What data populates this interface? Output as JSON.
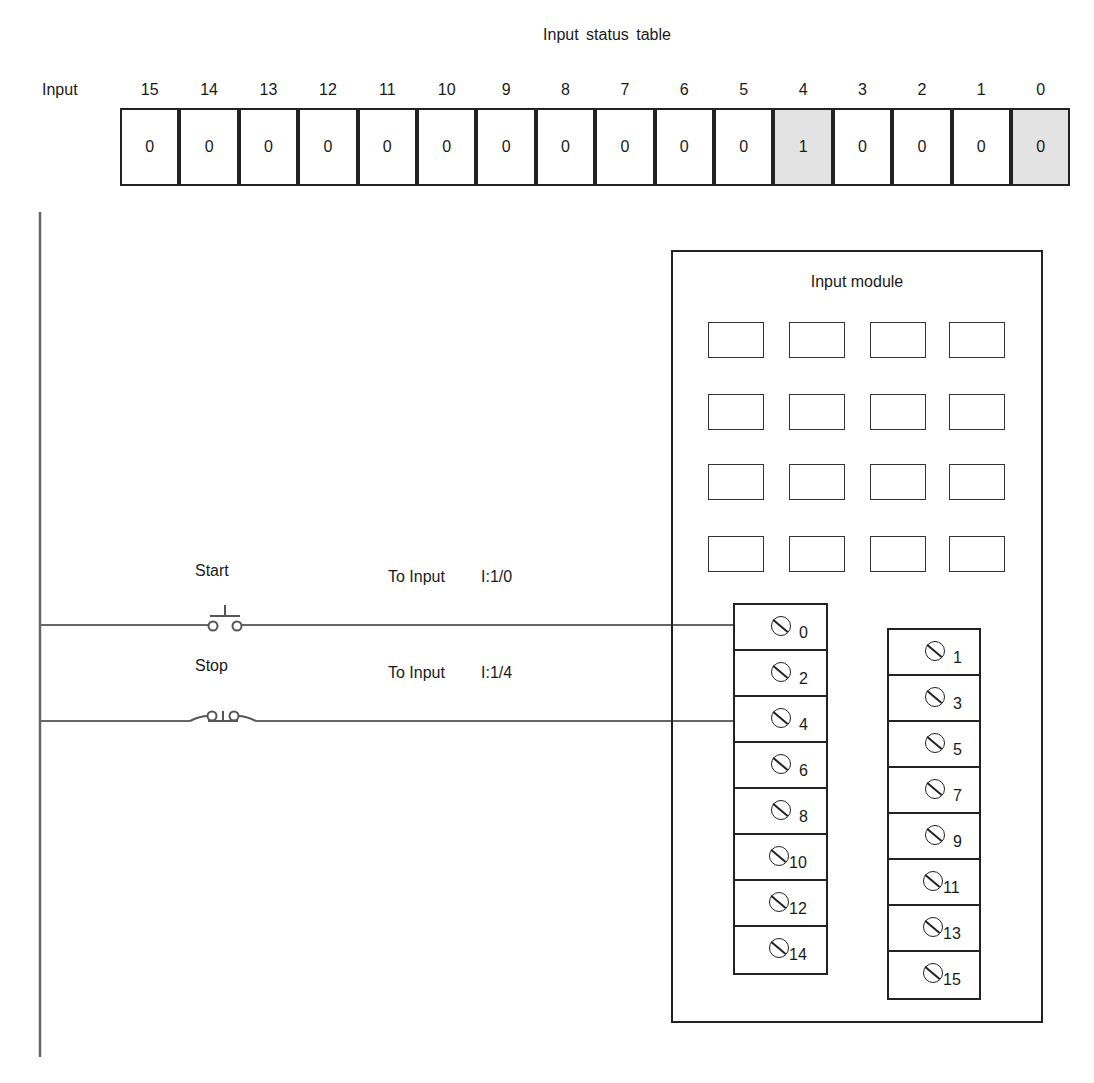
{
  "status_table": {
    "title": "Input status table",
    "row_label": "Input",
    "bits": [
      {
        "bit": "15",
        "value": "0",
        "highlight": false
      },
      {
        "bit": "14",
        "value": "0",
        "highlight": false
      },
      {
        "bit": "13",
        "value": "0",
        "highlight": false
      },
      {
        "bit": "12",
        "value": "0",
        "highlight": false
      },
      {
        "bit": "11",
        "value": "0",
        "highlight": false
      },
      {
        "bit": "10",
        "value": "0",
        "highlight": false
      },
      {
        "bit": "9",
        "value": "0",
        "highlight": false
      },
      {
        "bit": "8",
        "value": "0",
        "highlight": false
      },
      {
        "bit": "7",
        "value": "0",
        "highlight": false
      },
      {
        "bit": "6",
        "value": "0",
        "highlight": false
      },
      {
        "bit": "5",
        "value": "0",
        "highlight": false
      },
      {
        "bit": "4",
        "value": "1",
        "highlight": true
      },
      {
        "bit": "3",
        "value": "0",
        "highlight": false
      },
      {
        "bit": "2",
        "value": "0",
        "highlight": false
      },
      {
        "bit": "1",
        "value": "0",
        "highlight": false
      },
      {
        "bit": "0",
        "value": "0",
        "highlight": true
      }
    ],
    "highlight_color": "#e3e3e3"
  },
  "ladder": {
    "rungs": [
      {
        "device_label": "Start",
        "device_type": "normally-open-pushbutton",
        "to_label": "To Input",
        "address": "I:1/0"
      },
      {
        "device_label": "Stop",
        "device_type": "normally-closed-pushbutton",
        "to_label": "To Input",
        "address": "I:1/4"
      }
    ]
  },
  "module": {
    "title": "Input module",
    "indicator_rows": 4,
    "indicator_cols": 4,
    "left_terminals": [
      "0",
      "2",
      "4",
      "6",
      "8",
      "10",
      "12",
      "14"
    ],
    "right_terminals": [
      "1",
      "3",
      "5",
      "7",
      "9",
      "11",
      "13",
      "15"
    ]
  }
}
